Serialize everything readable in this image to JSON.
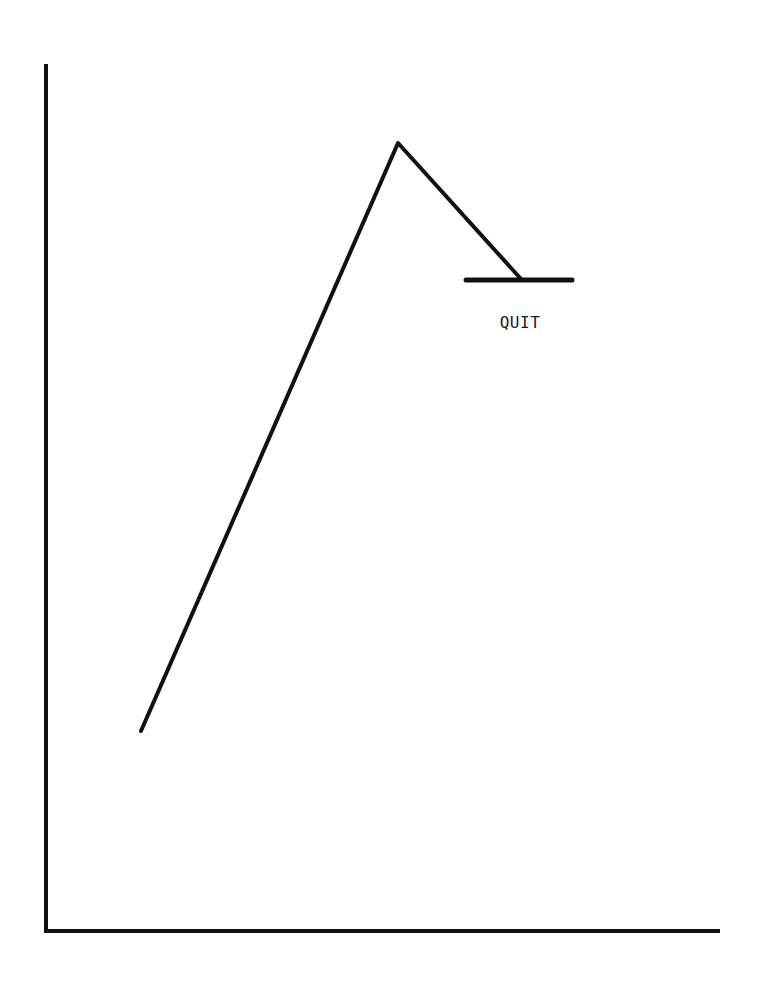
{
  "chart_data": {
    "type": "line",
    "title": "",
    "xlabel": "",
    "ylabel": "",
    "grid": false,
    "legend": null,
    "axes": {
      "y_axis": {
        "x": 46,
        "y_top": 66,
        "y_bottom": 931
      },
      "x_axis": {
        "y": 931,
        "x_left": 56,
        "x_right": 718
      }
    },
    "series": [
      {
        "name": "curve",
        "points_px": [
          [
            141,
            731
          ],
          [
            398,
            143
          ],
          [
            521,
            279
          ]
        ]
      }
    ],
    "annotations": [
      {
        "type": "horizontal-bar",
        "x1": 466,
        "x2": 572,
        "y": 280,
        "label": "QUIT",
        "label_x": 520,
        "label_y": 322
      }
    ],
    "colors": {
      "ink": "#111111",
      "background": "#ffffff"
    }
  }
}
